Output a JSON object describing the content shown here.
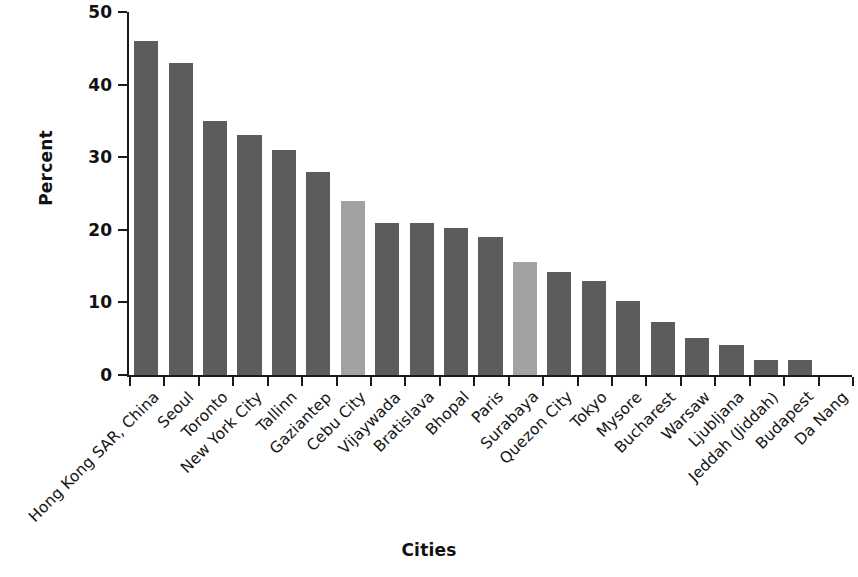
{
  "chart_data": {
    "type": "bar",
    "title": "",
    "xlabel": "Cities",
    "ylabel": "Percent",
    "ylim": [
      0,
      50
    ],
    "ytick_values": [
      0,
      10,
      20,
      30,
      40,
      50
    ],
    "ytick_labels": [
      "0",
      "10",
      "20",
      "30",
      "40",
      "50"
    ],
    "grid": false,
    "legend": "none",
    "categories": [
      "Hong Kong SAR, China",
      "Seoul",
      "Toronto",
      "New York City",
      "Tallinn",
      "Gaziantep",
      "Cebu City",
      "Vijaywada",
      "Bratislava",
      "Bhopal",
      "Paris",
      "Surabaya",
      "Quezon City",
      "Tokyo",
      "Mysore",
      "Bucharest",
      "Warsaw",
      "Ljubljana",
      "Jeddah (Jiddah)",
      "Budapest",
      "Da Nang"
    ],
    "values": [
      46,
      43,
      35,
      33,
      31,
      28,
      24,
      21,
      21,
      20.2,
      19,
      15.5,
      14.2,
      13,
      10.2,
      7.3,
      5.1,
      4.1,
      2,
      2,
      0
    ],
    "bar_colors": [
      "#5c5c5c",
      "#5c5c5c",
      "#5c5c5c",
      "#5c5c5c",
      "#5c5c5c",
      "#5c5c5c",
      "#a2a2a2",
      "#5c5c5c",
      "#5c5c5c",
      "#5c5c5c",
      "#5c5c5c",
      "#a2a2a2",
      "#5c5c5c",
      "#5c5c5c",
      "#5c5c5c",
      "#5c5c5c",
      "#5c5c5c",
      "#5c5c5c",
      "#5c5c5c",
      "#5c5c5c",
      "#5c5c5c"
    ],
    "highlight_color": "#a2a2a2",
    "default_bar_color": "#5c5c5c",
    "axis_color": "#1a1a1a"
  }
}
